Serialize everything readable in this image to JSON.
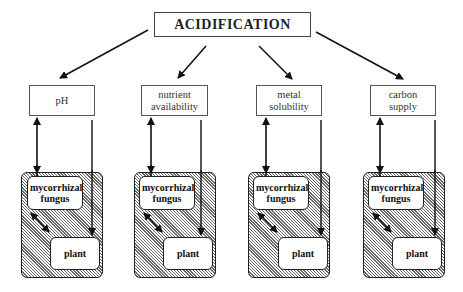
{
  "title": "ACIDIFICATION",
  "factors": [
    {
      "label": "pH",
      "x": 29,
      "w": 66
    },
    {
      "label": "nutrient availability",
      "x": 141,
      "w": 67
    },
    {
      "label": "metal solubility",
      "x": 256,
      "w": 66
    },
    {
      "label": "carbon supply",
      "x": 370,
      "w": 66
    }
  ],
  "groups": [
    {
      "fungus": "mycorrhizal fungus",
      "plant": "plant",
      "x": 21
    },
    {
      "fungus": "mycorrhizal fungus",
      "plant": "plant",
      "x": 134
    },
    {
      "fungus": "mycorrhizal fungus",
      "plant": "plant",
      "x": 248
    },
    {
      "fungus": "mycorrhizal fungus",
      "plant": "plant",
      "x": 363
    }
  ],
  "colors": {
    "line": "#111111",
    "hatch": "#6a6a6a",
    "border": "#555555"
  }
}
